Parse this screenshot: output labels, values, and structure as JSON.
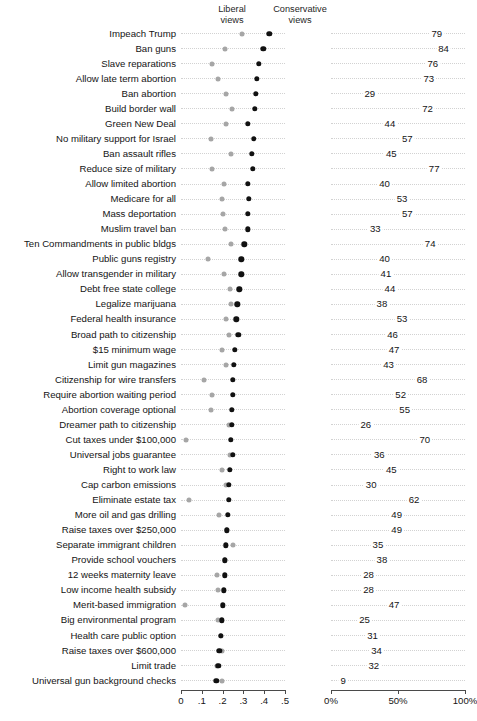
{
  "headers": {
    "liberal_line1": "Liberal",
    "liberal_line2": "views",
    "conservative_line1": "Conservative",
    "conservative_line2": "views"
  },
  "axes": {
    "left": {
      "ticks": [
        "0",
        ".1",
        ".2",
        ".3",
        ".4",
        ".5"
      ],
      "min": 0,
      "max": 0.5
    },
    "right": {
      "ticks": [
        "0%",
        "50%",
        "100%"
      ],
      "min": 0,
      "max": 100
    }
  },
  "colors": {
    "conservative_dot": "#111111",
    "liberal_dot": "#a6a6a6",
    "guide_line": "#d2d2d2",
    "axis": "#4a4a4a",
    "text": "#141414",
    "background": "#ffffff"
  },
  "chart_data": {
    "type": "scatter",
    "title": "",
    "xlabel": "",
    "ylabel": "",
    "left_panel": {
      "xlim": [
        0,
        0.5
      ],
      "ticks": [
        "0",
        ".1",
        ".2",
        ".3",
        ".4",
        ".5"
      ],
      "grid": "dotted",
      "series": [
        {
          "name": "Liberal views",
          "color": "#a6a6a6"
        },
        {
          "name": "Conservative views",
          "color": "#111111"
        }
      ]
    },
    "right_panel": {
      "xlim": [
        0,
        100
      ],
      "ticks": [
        "0%",
        "50%",
        "100%"
      ],
      "grid": "dotted"
    },
    "categories": [
      "Impeach Trump",
      "Ban guns",
      "Slave reparations",
      "Allow late term abortion",
      "Ban abortion",
      "Build border wall",
      "Green New Deal",
      "No military support for Israel",
      "Ban assault rifles",
      "Reduce size of military",
      "Allow limited abortion",
      "Medicare for all",
      "Mass deportation",
      "Muslim travel ban",
      "Ten Commandments in public bldgs",
      "Public guns registry",
      "Allow transgender in military",
      "Debt free state college",
      "Legalize marijuana",
      "Federal health insurance",
      "Broad path to citizenship",
      "$15 minimum wage",
      "Limit gun magazines",
      "Citizenship for wire transfers",
      "Require abortion waiting period",
      "Abortion coverage optional",
      "Dreamer path to citizenship",
      "Cut taxes under $100,000",
      "Universal jobs guarantee",
      "Right to work law",
      "Cap carbon emissions",
      "Eliminate estate tax",
      "More oil and gas drilling",
      "Raise taxes over $250,000",
      "Separate immigrant children",
      "Provide school vouchers",
      "12 weeks maternity leave",
      "Low income health subsidy",
      "Merit-based immigration",
      "Big environmental program",
      "Health care public option",
      "Raise taxes over $600,000",
      "Limit trade",
      "Universal gun background checks"
    ],
    "rows": [
      {
        "label": "Impeach Trump",
        "liberal": 0.295,
        "conservative": 0.425,
        "value": 79
      },
      {
        "label": "Ban guns",
        "liberal": 0.21,
        "conservative": 0.395,
        "value": 84
      },
      {
        "label": "Slave reparations",
        "liberal": 0.15,
        "conservative": 0.375,
        "value": 76
      },
      {
        "label": "Allow late term abortion",
        "liberal": 0.18,
        "conservative": 0.365,
        "value": 73
      },
      {
        "label": "Ban abortion",
        "liberal": 0.215,
        "conservative": 0.36,
        "value": 29
      },
      {
        "label": "Build border wall",
        "liberal": 0.245,
        "conservative": 0.355,
        "value": 72
      },
      {
        "label": "Green New Deal",
        "liberal": 0.215,
        "conservative": 0.32,
        "value": 44
      },
      {
        "label": "No military support for Israel",
        "liberal": 0.145,
        "conservative": 0.35,
        "value": 57
      },
      {
        "label": "Ban assault rifles",
        "liberal": 0.24,
        "conservative": 0.34,
        "value": 45
      },
      {
        "label": "Reduce size of military",
        "liberal": 0.15,
        "conservative": 0.345,
        "value": 77
      },
      {
        "label": "Allow limited abortion",
        "liberal": 0.205,
        "conservative": 0.32,
        "value": 40
      },
      {
        "label": "Medicare for all",
        "liberal": 0.195,
        "conservative": 0.325,
        "value": 53
      },
      {
        "label": "Mass deportation",
        "liberal": 0.2,
        "conservative": 0.32,
        "value": 57
      },
      {
        "label": "Muslim travel ban",
        "liberal": 0.21,
        "conservative": 0.32,
        "value": 33
      },
      {
        "label": "Ten Commandments in public bldgs",
        "liberal": 0.24,
        "conservative": 0.305,
        "value": 74
      },
      {
        "label": "Public guns registry",
        "liberal": 0.13,
        "conservative": 0.29,
        "value": 40
      },
      {
        "label": "Allow transgender in military",
        "liberal": 0.205,
        "conservative": 0.29,
        "value": 41
      },
      {
        "label": "Debt free state college",
        "liberal": 0.235,
        "conservative": 0.28,
        "value": 44
      },
      {
        "label": "Legalize marijuana",
        "liberal": 0.24,
        "conservative": 0.27,
        "value": 38
      },
      {
        "label": "Federal health insurance",
        "liberal": 0.215,
        "conservative": 0.265,
        "value": 53
      },
      {
        "label": "Broad path to citizenship",
        "liberal": 0.23,
        "conservative": 0.275,
        "value": 46
      },
      {
        "label": "$15 minimum wage",
        "liberal": 0.195,
        "conservative": 0.26,
        "value": 47
      },
      {
        "label": "Limit gun magazines",
        "liberal": 0.215,
        "conservative": 0.255,
        "value": 43
      },
      {
        "label": "Citizenship for wire transfers",
        "liberal": 0.11,
        "conservative": 0.25,
        "value": 68
      },
      {
        "label": "Require abortion waiting period",
        "liberal": 0.15,
        "conservative": 0.25,
        "value": 52
      },
      {
        "label": "Abortion coverage optional",
        "liberal": 0.145,
        "conservative": 0.245,
        "value": 55
      },
      {
        "label": "Dreamer path to citizenship",
        "liberal": 0.23,
        "conservative": 0.245,
        "value": 26
      },
      {
        "label": "Cut taxes under $100,000",
        "liberal": 0.025,
        "conservative": 0.24,
        "value": 70
      },
      {
        "label": "Universal jobs guarantee",
        "liberal": 0.235,
        "conservative": 0.25,
        "value": 36
      },
      {
        "label": "Right to work law",
        "liberal": 0.195,
        "conservative": 0.235,
        "value": 45
      },
      {
        "label": "Cap carbon emissions",
        "liberal": 0.215,
        "conservative": 0.23,
        "value": 30
      },
      {
        "label": "Eliminate estate tax",
        "liberal": 0.04,
        "conservative": 0.23,
        "value": 62
      },
      {
        "label": "More oil and gas drilling",
        "liberal": 0.185,
        "conservative": 0.225,
        "value": 49
      },
      {
        "label": "Raise taxes over $250,000",
        "liberal": 0.22,
        "conservative": 0.22,
        "value": 49
      },
      {
        "label": "Separate immigrant children",
        "liberal": 0.25,
        "conservative": 0.215,
        "value": 35
      },
      {
        "label": "Provide school vouchers",
        "liberal": 0.21,
        "conservative": 0.21,
        "value": 38
      },
      {
        "label": "12 weeks maternity leave",
        "liberal": 0.175,
        "conservative": 0.21,
        "value": 28
      },
      {
        "label": "Low income health subsidy",
        "liberal": 0.18,
        "conservative": 0.205,
        "value": 28
      },
      {
        "label": "Merit-based immigration",
        "liberal": 0.02,
        "conservative": 0.2,
        "value": 47
      },
      {
        "label": "Big environmental program",
        "liberal": 0.18,
        "conservative": 0.195,
        "value": 25
      },
      {
        "label": "Health care public option",
        "liberal": 0.19,
        "conservative": 0.19,
        "value": 31
      },
      {
        "label": "Raise taxes over $600,000",
        "liberal": 0.195,
        "conservative": 0.185,
        "value": 34
      },
      {
        "label": "Limit trade",
        "liberal": 0.175,
        "conservative": 0.18,
        "value": 32
      },
      {
        "label": "Universal gun background checks",
        "liberal": 0.195,
        "conservative": 0.17,
        "value": 9
      }
    ]
  }
}
